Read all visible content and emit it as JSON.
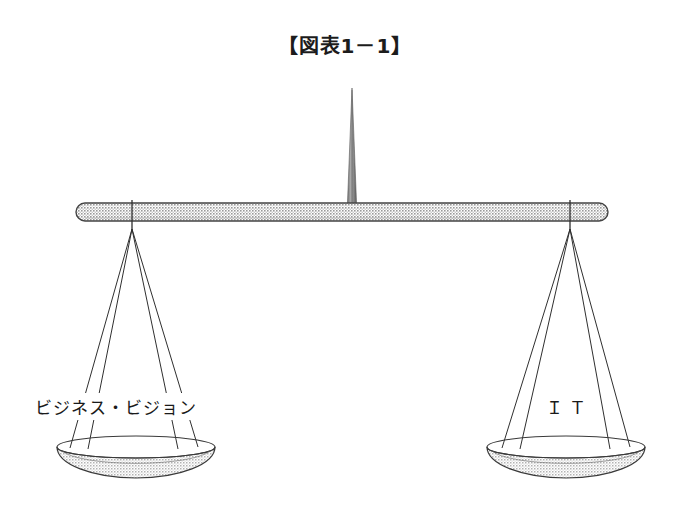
{
  "figure": {
    "title": "【図表1－1】",
    "kind": "balance-scale-illustration",
    "background_color": "#ffffff",
    "line_color": "#2b2b2b",
    "fill_color": "#b9b9b9",
    "beam": {
      "left_x": 76,
      "right_x": 608,
      "center_y": 212,
      "thickness": 18
    },
    "fulcrum": {
      "tip_x": 352,
      "tip_y": 88,
      "base_y": 207,
      "base_width": 11
    },
    "left_pan": {
      "label": "ビジネス・ビジョン",
      "anchor_x": 132,
      "anchor_y": 228,
      "rim_cx": 136,
      "rim_cy": 447,
      "rim_rx": 79,
      "rim_ry": 11,
      "bowl_depth": 29
    },
    "right_pan": {
      "label": "ＩＴ",
      "anchor_x": 570,
      "anchor_y": 228,
      "rim_cx": 566,
      "rim_cy": 447,
      "rim_rx": 79,
      "rim_ry": 11,
      "bowl_depth": 29
    }
  }
}
